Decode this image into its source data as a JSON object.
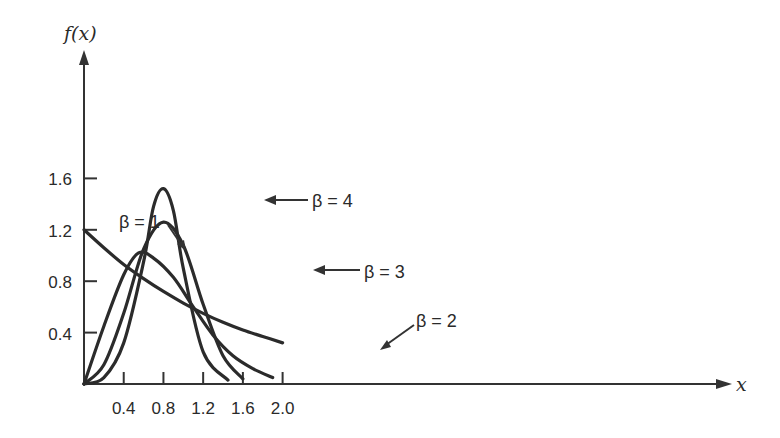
{
  "chart_data": {
    "type": "line",
    "title": "",
    "xlabel": "x",
    "ylabel": "f(x)",
    "xlim": [
      0,
      2.5
    ],
    "ylim": [
      0,
      1.6
    ],
    "grid": false,
    "x_ticks": [
      "0.4",
      "0.8",
      "1.2",
      "1.6",
      "2.0"
    ],
    "y_ticks": [
      "0.4",
      "0.8",
      "1.2",
      "1.6"
    ],
    "legend_position": "inline annotations with arrows",
    "series": [
      {
        "name": "β = 1",
        "x": [
          0.0,
          0.2,
          0.4,
          0.6,
          0.8,
          1.0,
          1.2,
          1.4,
          1.6,
          1.8,
          2.0
        ],
        "y": [
          1.2,
          1.06,
          0.93,
          0.82,
          0.72,
          0.63,
          0.55,
          0.48,
          0.42,
          0.37,
          0.32
        ]
      },
      {
        "name": "β = 2",
        "x": [
          0.0,
          0.2,
          0.4,
          0.55,
          0.7,
          0.9,
          1.1,
          1.3,
          1.5,
          1.7,
          1.9
        ],
        "y": [
          0.0,
          0.45,
          0.85,
          1.02,
          0.98,
          0.83,
          0.6,
          0.38,
          0.22,
          0.12,
          0.05
        ]
      },
      {
        "name": "β = 3",
        "x": [
          0.0,
          0.2,
          0.4,
          0.6,
          0.8,
          1.0,
          1.2,
          1.4,
          1.6
        ],
        "y": [
          0.0,
          0.15,
          0.55,
          1.05,
          1.26,
          1.08,
          0.62,
          0.22,
          0.04
        ]
      },
      {
        "name": "β = 4",
        "x": [
          0.0,
          0.2,
          0.4,
          0.6,
          0.7,
          0.8,
          0.9,
          1.0,
          1.2,
          1.45
        ],
        "y": [
          0.0,
          0.05,
          0.32,
          0.95,
          1.38,
          1.52,
          1.35,
          0.9,
          0.25,
          0.03
        ]
      }
    ]
  },
  "labels": {
    "y_axis_title": "f(x)",
    "x_axis_title": "x",
    "beta1": "β = 1",
    "beta2": "β = 2",
    "beta3": "β = 3",
    "beta4": "β = 4"
  }
}
